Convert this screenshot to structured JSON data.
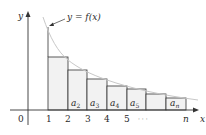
{
  "figure": {
    "type": "diagram",
    "curve_label": "y = f(x)",
    "axes": {
      "x_label": "x",
      "y_label": "y",
      "origin_label": "0",
      "x_ticks": [
        "1",
        "2",
        "3",
        "4",
        "5",
        "· · ·",
        "n"
      ]
    },
    "rectangles": [
      {
        "label": "",
        "sub": ""
      },
      {
        "label": "a",
        "sub": "2"
      },
      {
        "label": "a",
        "sub": "3"
      },
      {
        "label": "a",
        "sub": "4"
      },
      {
        "label": "a",
        "sub": "5"
      },
      {
        "label": "",
        "sub": ""
      },
      {
        "label": "a",
        "sub": "n"
      }
    ],
    "colors": {
      "rect_fill": "#f2f2f2",
      "curve": "#c8c8c8",
      "lines": "#333333"
    }
  }
}
